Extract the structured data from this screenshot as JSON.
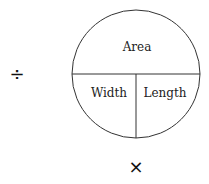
{
  "diagram": {
    "circle": {
      "top_label": "Area",
      "bottom_left_label": "Width",
      "bottom_right_label": "Length"
    },
    "operators": {
      "left": "÷",
      "bottom": "×"
    },
    "colors": {
      "stroke": "#333333",
      "text": "#222222",
      "background": "#ffffff"
    }
  }
}
